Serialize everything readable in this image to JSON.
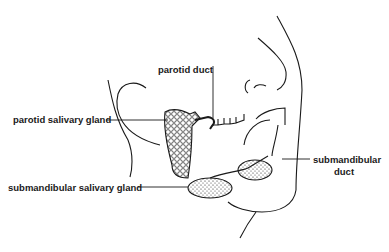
{
  "diagram": {
    "labels": {
      "parotid_duct": "parotid duct",
      "parotid_gland": "parotid salivary gland",
      "submandibular_duct_1": "submandibular",
      "submandibular_duct_2": "duct",
      "submandibular_gland": "submandibular salivary gland"
    },
    "colors": {
      "line": "#1a1a1a",
      "background": "#ffffff"
    }
  }
}
